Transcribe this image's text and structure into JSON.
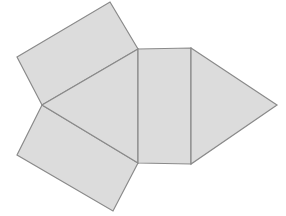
{
  "figure": {
    "canvas": {
      "width": 286,
      "height": 216
    },
    "background_color": "#ffffff",
    "fill_color": "#dcdcdc",
    "stroke_color": "#8c8c8c",
    "stroke_width": 1.2,
    "face_count": 5,
    "faces": [
      {
        "name": "top-left-quadrilateral",
        "shape": "quadrilateral",
        "points": "17,57 110,2 138,49 42,105",
        "fill": "#dcdcdc",
        "stroke": "#8a8a8a"
      },
      {
        "name": "bottom-left-quadrilateral",
        "shape": "quadrilateral",
        "points": "42,105 138,163 113,211 17,155",
        "fill": "#dcdcdc",
        "stroke": "#8a8a8a"
      },
      {
        "name": "center-left-triangle",
        "shape": "triangle",
        "points": "42,105 138,49 138,163",
        "fill": "#dcdcdc",
        "stroke": "#8a8a8a"
      },
      {
        "name": "center-rectangle",
        "shape": "rectangle",
        "points": "138,49 191,48 191,164 138,163",
        "fill": "#dcdcdc",
        "stroke": "#8a8a8a"
      },
      {
        "name": "right-triangle",
        "shape": "triangle",
        "points": "191,48 277,105 191,164",
        "fill": "#dcdcdc",
        "stroke": "#8a8a8a"
      }
    ],
    "vertices": [
      {
        "name": "top-apex",
        "x": 110,
        "y": 2
      },
      {
        "name": "left-upper",
        "x": 17,
        "y": 57
      },
      {
        "name": "center-junction",
        "x": 42,
        "y": 105
      },
      {
        "name": "left-lower",
        "x": 17,
        "y": 155
      },
      {
        "name": "bottom-apex",
        "x": 113,
        "y": 211
      },
      {
        "name": "rect-top-left",
        "x": 138,
        "y": 49
      },
      {
        "name": "rect-top-right",
        "x": 191,
        "y": 48
      },
      {
        "name": "rect-bottom-right",
        "x": 191,
        "y": 164
      },
      {
        "name": "rect-bottom-left",
        "x": 138,
        "y": 163
      },
      {
        "name": "right-apex",
        "x": 277,
        "y": 105
      }
    ]
  }
}
